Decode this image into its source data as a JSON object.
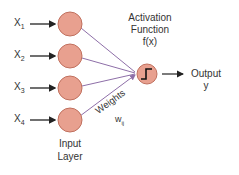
{
  "diagram": {
    "type": "perceptron",
    "inputs": [
      {
        "label": "X",
        "sub": "1"
      },
      {
        "label": "X",
        "sub": "2"
      },
      {
        "label": "X",
        "sub": "3"
      },
      {
        "label": "X",
        "sub": "4"
      }
    ],
    "input_layer_label_line1": "Input",
    "input_layer_label_line2": "Layer",
    "weights_label": "Weights",
    "weights_symbol": "w",
    "weights_sub": "ij",
    "activation_line1": "Activation",
    "activation_line2": "Function",
    "activation_line3": "f(x)",
    "output_line1": "Output",
    "output_line2": "y",
    "colors": {
      "node_fill": "#e8a08f",
      "node_stroke": "#c0705e",
      "edge": "#8e6fa8",
      "arrow": "#222222"
    }
  }
}
